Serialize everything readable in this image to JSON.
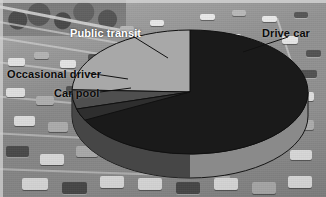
{
  "image": {
    "width": 326,
    "height": 197,
    "background_description": "grayscale aerial photo of congested multi-lane freeway traffic",
    "frame_color": "#d5d5d5"
  },
  "chart_data": {
    "type": "pie",
    "title": "",
    "subtitle": "",
    "xlabel": "",
    "ylabel": "",
    "three_d": true,
    "legend_position": "none",
    "grid": false,
    "labels_are_callouts": true,
    "categories": [
      "Drive car",
      "Public transit",
      "Occasional driver",
      "Car pool"
    ],
    "values": [
      70,
      22,
      5,
      3
    ],
    "units": "percent",
    "series": [
      {
        "name": "Commute mode share",
        "values": [
          70,
          22,
          5,
          3
        ]
      }
    ],
    "slices": [
      {
        "label": "Drive car",
        "value": 70,
        "color": "#1a1a1a",
        "label_color": "#0b0b0b",
        "start_deg": 270,
        "end_deg": 522
      },
      {
        "label": "Public transit",
        "value": 22,
        "color": "#a8a8a8",
        "label_color": "#ffffff",
        "start_deg": 182,
        "end_deg": 270
      },
      {
        "label": "Occasional driver",
        "value": 5,
        "color": "#4f4f4f",
        "label_color": "#0b0b0b",
        "start_deg": 164,
        "end_deg": 182
      },
      {
        "label": "Car pool",
        "value": 3,
        "color": "#2e2e2e",
        "label_color": "#0b0b0b",
        "start_deg": 153,
        "end_deg": 164
      }
    ]
  },
  "labels": {
    "public_transit": "Public transit",
    "drive_car": "Drive car",
    "occasional_driver": "Occasional driver",
    "car_pool": "Car pool"
  },
  "colors": {
    "drive_car": "#1a1a1a",
    "public_transit": "#a8a8a8",
    "occasional_driver": "#4f4f4f",
    "car_pool": "#2e2e2e",
    "pie_side_wall": "#8a8a8a",
    "pie_outline": "#101010",
    "label_dark": "#0b0b0b",
    "label_light": "#ffffff"
  },
  "geometry": {
    "center_x": 190,
    "center_y": 92,
    "radius_x": 118,
    "radius_y": 62,
    "depth": 24
  }
}
